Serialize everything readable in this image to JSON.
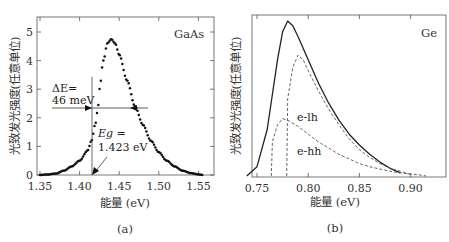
{
  "chart_data": [
    {
      "panel": "(a)",
      "type": "scatter",
      "title": "GaAs",
      "xlabel": "能量 (eV)",
      "ylabel": "光致发光强度(任意单位)",
      "xlim": [
        1.34,
        1.565
      ],
      "ylim": [
        0,
        5.5
      ],
      "xticks": [
        "1.35",
        "1.40",
        "1.45",
        "1.50",
        "1.55"
      ],
      "yticks": [
        "0",
        "1",
        "2",
        "3",
        "4",
        "5"
      ],
      "grid": false,
      "series": [
        {
          "name": "GaAs PL",
          "x": [
            1.35,
            1.36,
            1.37,
            1.38,
            1.39,
            1.4,
            1.41,
            1.415,
            1.42,
            1.423,
            1.425,
            1.43,
            1.435,
            1.44,
            1.445,
            1.45,
            1.46,
            1.47,
            1.48,
            1.49,
            1.5,
            1.51,
            1.52,
            1.53,
            1.54,
            1.55,
            1.555
          ],
          "values": [
            0.0,
            0.02,
            0.05,
            0.15,
            0.3,
            0.5,
            0.85,
            1.2,
            1.8,
            2.3,
            3.0,
            4.0,
            4.6,
            4.75,
            4.6,
            4.2,
            3.3,
            2.4,
            1.75,
            1.2,
            0.8,
            0.5,
            0.3,
            0.15,
            0.07,
            0.02,
            0.0
          ]
        }
      ],
      "annotations": [
        {
          "text": "ΔE= 46 meV",
          "type": "FWHM arrows",
          "y": 2.35,
          "x_range": [
            1.423,
            1.469
          ]
        },
        {
          "text": "Eg = 1.423 eV",
          "type": "arrow",
          "x": 1.423
        }
      ],
      "caption": "(a)"
    },
    {
      "panel": "(b)",
      "type": "line",
      "title": "Ge",
      "xlabel": "能量 (eV)",
      "ylabel": "光致发光强度(任意单位)",
      "xlim": [
        0.74,
        0.92
      ],
      "xticks": [
        "0.75",
        "0.80",
        "0.85",
        "0.90"
      ],
      "grid": false,
      "series": [
        {
          "name": "total",
          "style": "solid",
          "x": [
            0.74,
            0.75,
            0.76,
            0.77,
            0.775,
            0.78,
            0.785,
            0.79,
            0.8,
            0.81,
            0.82,
            0.83,
            0.84,
            0.85,
            0.86,
            0.87,
            0.88,
            0.89
          ],
          "values": [
            0.0,
            0.06,
            0.3,
            0.75,
            0.93,
            1.0,
            0.97,
            0.9,
            0.75,
            0.6,
            0.47,
            0.36,
            0.27,
            0.2,
            0.14,
            0.09,
            0.05,
            0.02
          ]
        },
        {
          "name": "e-lh",
          "style": "dashed",
          "x": [
            0.779,
            0.78,
            0.785,
            0.79,
            0.795,
            0.8,
            0.81,
            0.82,
            0.83,
            0.84,
            0.85,
            0.86,
            0.87,
            0.88,
            0.89,
            0.9
          ],
          "values": [
            0.0,
            0.5,
            0.7,
            0.78,
            0.75,
            0.68,
            0.55,
            0.43,
            0.33,
            0.24,
            0.17,
            0.12,
            0.08,
            0.05,
            0.03,
            0.01
          ]
        },
        {
          "name": "e-hh",
          "style": "dashed",
          "x": [
            0.764,
            0.765,
            0.77,
            0.775,
            0.78,
            0.79,
            0.8,
            0.81,
            0.82,
            0.83,
            0.84,
            0.85,
            0.86,
            0.87,
            0.88,
            0.89,
            0.9,
            0.91,
            0.915
          ],
          "values": [
            0.0,
            0.22,
            0.33,
            0.37,
            0.36,
            0.32,
            0.27,
            0.22,
            0.18,
            0.14,
            0.11,
            0.08,
            0.06,
            0.045,
            0.03,
            0.02,
            0.012,
            0.006,
            0.0
          ]
        }
      ],
      "annotations": [
        {
          "text": "e-lh"
        },
        {
          "text": "e-hh"
        }
      ],
      "caption": "(b)"
    }
  ],
  "panel_a": {
    "material": "GaAs",
    "ylabel": "光致发光强度(任意单位)",
    "xlabel": "能量 (eV)",
    "caption": "(a)",
    "xticks": [
      "1.35",
      "1.40",
      "1.45",
      "1.50",
      "1.55"
    ],
    "yticks": [
      "0",
      "1",
      "2",
      "3",
      "4",
      "5"
    ],
    "delta_e_line1": "ΔE=",
    "delta_e_line2": "46 meV",
    "eg_line1": "Eg =",
    "eg_line2": "1.423 eV"
  },
  "panel_b": {
    "material": "Ge",
    "ylabel": "光致发光强度(任意单位)",
    "xlabel": "能量 (eV)",
    "caption": "(b)",
    "xticks": [
      "0.75",
      "0.80",
      "0.85",
      "0.90"
    ],
    "label_elh": "e-lh",
    "label_ehh": "e-hh"
  }
}
